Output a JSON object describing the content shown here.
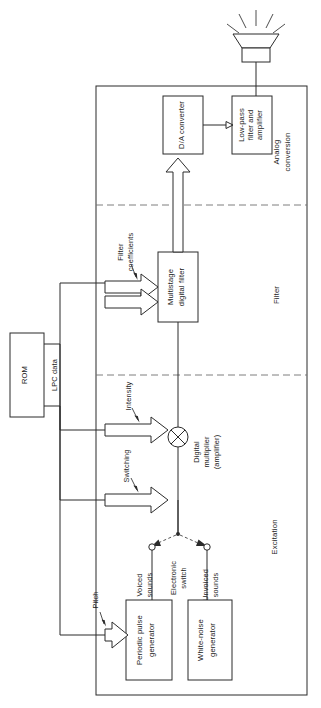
{
  "figure": {
    "type": "block-diagram",
    "title_visible": false
  },
  "blocks": {
    "rom": {
      "label": "ROM"
    },
    "multistage_filter": {
      "line1": "Multistage",
      "line2": "digital filter"
    },
    "da_converter": {
      "label": "D/A converter"
    },
    "lowpass": {
      "line1": "Low-pass",
      "line2": "filter and",
      "line3": "amplifier"
    },
    "periodic_pulse": {
      "line1": "Periodic pulse",
      "line2": "generator"
    },
    "white_noise": {
      "line1": "White-noise",
      "line2": "generator"
    }
  },
  "regions": {
    "analog": {
      "line1": "Analog",
      "line2": "conversion"
    },
    "filter": {
      "label": "Filter"
    },
    "excitation": {
      "label": "Excitation"
    }
  },
  "signals": {
    "lpc_data": {
      "label": "LPC data"
    },
    "filter_coefficients": {
      "line1": "Filter",
      "line2": "coefficients"
    },
    "intensity": {
      "label": "Intensity"
    },
    "switching": {
      "label": "Switching"
    },
    "pitch": {
      "label": "Pitch"
    }
  },
  "nodes": {
    "multiplier": {
      "line1": "Digital",
      "line2": "multiplier",
      "line3": "(amplifier)",
      "glyph": "circle-times"
    },
    "electronic_switch": {
      "line1": "Electronic",
      "line2": "switch"
    },
    "voiced": {
      "line1": "Voiced",
      "line2": "sounds"
    },
    "unvoiced": {
      "line1": "Unvoiced",
      "line2": "sounds"
    }
  },
  "icons": {
    "speaker": {
      "name": "loudspeaker-icon",
      "rays": 5
    }
  },
  "colors": {
    "ink": "#2b2b2b",
    "background": "#ffffff",
    "divider": "#6f6f6f"
  }
}
